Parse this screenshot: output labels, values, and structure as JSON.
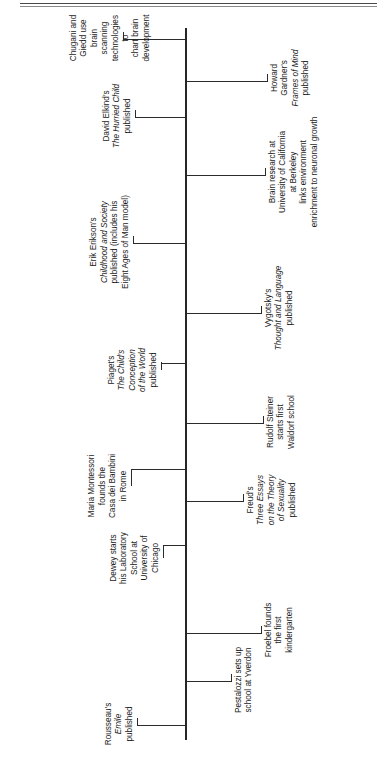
{
  "document": {
    "title": "Timeline of Child Development Theory and Research",
    "orientation": "rotated-90-counterclockwise",
    "axis_color": "#262626",
    "text_color": "#1a1a1a",
    "rule_color": "#4a4a4a"
  },
  "chart_data": {
    "type": "timeline",
    "title": "",
    "xlabel": "",
    "ylabel": "",
    "grid": false,
    "legend": "none",
    "axis_ticks": [
      "1762",
      "1804",
      "1837",
      "1896",
      "1905",
      "1907",
      "1913",
      "1926",
      "1934",
      "1950",
      "1964",
      "1981",
      "1983",
      "1990s"
    ],
    "events": [
      {
        "year": "1762",
        "side": "above",
        "text": "Rousseau's\nEmile\npublished",
        "italic_lines": [
          1
        ]
      },
      {
        "year": "1804",
        "side": "below",
        "text": "Pestalozzi sets up\nschool at Yverdon",
        "italic_lines": []
      },
      {
        "year": "1837",
        "side": "below",
        "text": "Froebel founds\nthe first\nkindergarten",
        "italic_lines": []
      },
      {
        "year": "1896",
        "side": "above",
        "text": "Dewey starts\nhis Laboratory\nSchool at\nUniversity of\nChicago",
        "italic_lines": []
      },
      {
        "year": "1905",
        "side": "below",
        "text": "Freud's\nThree Essays\non the Theory\nof Sexuality\npublished",
        "italic_lines": [
          1,
          2,
          3
        ]
      },
      {
        "year": "1907",
        "side": "above",
        "text": "Maria Montessori\nfounds the\nCasa dei Bambini\nin Rome",
        "italic_lines": []
      },
      {
        "year": "1913",
        "side": "below",
        "text": "Rudolf Steiner\nstarts first\nWaldorf school",
        "italic_lines": []
      },
      {
        "year": "1926",
        "side": "above",
        "text": "Piaget's\nThe Child's\nConception\nof the World\npublished",
        "italic_lines": [
          1,
          2,
          3
        ]
      },
      {
        "year": "1934",
        "side": "below",
        "text": "Vygotsky's\nThought and Language\npublished",
        "italic_lines": [
          1
        ]
      },
      {
        "year": "1950",
        "side": "above",
        "text": "Erik Erikson's\nChildhood and Society\npublished (includes his\nEight Ages of Man model)",
        "italic_lines": [
          1
        ]
      },
      {
        "year": "1964",
        "side": "below",
        "text": "Brain research at\nUniversity of California\nat Berkeley\nlinks environment\nenrichment to neuronal growth",
        "italic_lines": []
      },
      {
        "year": "1981",
        "side": "above",
        "text": "David Elkind's\nThe Hurried Child\npublished",
        "italic_lines": [
          1
        ]
      },
      {
        "year": "1983",
        "side": "below",
        "text": "Howard Gardner's\nFrames of Mind\npublished",
        "italic_lines": [
          1
        ]
      },
      {
        "year": "1990s",
        "side": "above",
        "text": "Chugani and Giedd use\nbrain scanning\ntechnologies to\nchart brain\ndevelopment",
        "italic_lines": []
      }
    ]
  },
  "ticks": [
    {
      "label": "1762",
      "x": 28
    },
    {
      "label": "1804",
      "x": 72
    },
    {
      "label": "1837",
      "x": 120
    },
    {
      "label": "1896",
      "x": 208
    },
    {
      "label": "1905",
      "x": 252
    },
    {
      "label": "1907",
      "x": 284
    },
    {
      "label": "1913",
      "x": 330
    },
    {
      "label": "1926",
      "x": 390
    },
    {
      "label": "1934",
      "x": 440
    },
    {
      "label": "1950",
      "x": 510
    },
    {
      "label": "1964",
      "x": 578
    },
    {
      "label": "1981",
      "x": 636
    },
    {
      "label": "1983",
      "x": 672
    },
    {
      "label": "1990s",
      "x": 714
    }
  ]
}
